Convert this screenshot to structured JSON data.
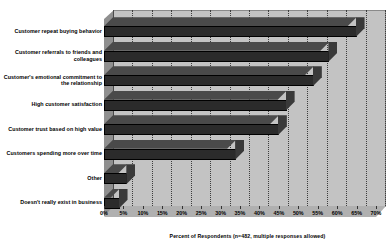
{
  "chart_data": {
    "type": "bar",
    "orientation": "horizontal",
    "title": "",
    "subtitle": "",
    "xlabel": "Percent of Respondents (n=482, multiple responses allowed)",
    "ylabel": "",
    "xlim": [
      0,
      70
    ],
    "xtick_labels": [
      "0%",
      "5%",
      "10%",
      "15%",
      "20%",
      "25%",
      "30%",
      "35%",
      "40%",
      "45%",
      "50%",
      "55%",
      "60%",
      "65%",
      "70%"
    ],
    "xtick_values": [
      0,
      5,
      10,
      15,
      20,
      25,
      30,
      35,
      40,
      45,
      50,
      55,
      60,
      65,
      70
    ],
    "grid": true,
    "grid_style": "dotted-vertical",
    "legend": false,
    "style": "3d-grayscale",
    "categories": [
      "Customer repeat buying behavior",
      "Customer referrals to friends and colleagues",
      "Customer's emotional commitment to the relationship",
      "High customer satisfaction",
      "Customer trust based on high value",
      "Customers spending more over time",
      "Other",
      "Doesn't really exist in business"
    ],
    "values": [
      65,
      58,
      54,
      47,
      45,
      34,
      6,
      4
    ],
    "bar_color": "#2b2b2b",
    "plot_background": "#c3c3c3",
    "floor_color": "#b0b0b0",
    "wall_color": "#8f8f8f",
    "gridline_color": "#3d3d3d"
  }
}
